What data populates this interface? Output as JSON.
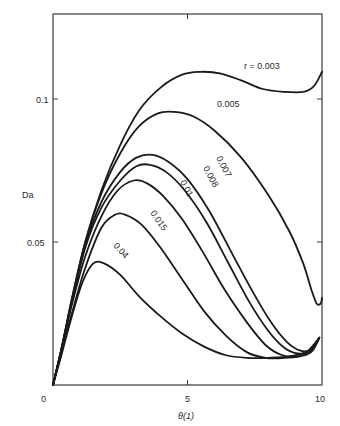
{
  "chart_data": {
    "type": "line",
    "title": "",
    "xlabel": "θ(1)",
    "ylabel": "Da",
    "xlim": [
      0,
      10
    ],
    "ylim": [
      0,
      0.13
    ],
    "grid": false,
    "legend": "inline curve labels",
    "x_ticks": [
      "0",
      "5",
      "10"
    ],
    "y_ticks": [
      "0.05",
      "0.1"
    ],
    "series": [
      {
        "name": "r = 0.003",
        "label": "r = 0.003",
        "points": [
          [
            0,
            0
          ],
          [
            0.3,
            0.012
          ],
          [
            0.7,
            0.03
          ],
          [
            1.2,
            0.05
          ],
          [
            1.8,
            0.068
          ],
          [
            2.5,
            0.084
          ],
          [
            3.2,
            0.096
          ],
          [
            4.0,
            0.104
          ],
          [
            4.8,
            0.1085
          ],
          [
            5.5,
            0.1095
          ],
          [
            6.2,
            0.109
          ],
          [
            7.0,
            0.1065
          ],
          [
            7.8,
            0.1035
          ],
          [
            8.6,
            0.1025
          ],
          [
            9.3,
            0.1025
          ],
          [
            9.7,
            0.1045
          ],
          [
            10,
            0.1095
          ]
        ]
      },
      {
        "name": "0.005",
        "label": "0.005",
        "points": [
          [
            0,
            0
          ],
          [
            0.3,
            0.012
          ],
          [
            0.7,
            0.03
          ],
          [
            1.2,
            0.05
          ],
          [
            1.8,
            0.067
          ],
          [
            2.5,
            0.081
          ],
          [
            3.2,
            0.0905
          ],
          [
            3.9,
            0.095
          ],
          [
            4.5,
            0.0955
          ],
          [
            5.2,
            0.094
          ],
          [
            6.0,
            0.089
          ],
          [
            7.0,
            0.0795
          ],
          [
            8.0,
            0.0665
          ],
          [
            8.8,
            0.0535
          ],
          [
            9.3,
            0.0425
          ],
          [
            9.6,
            0.0335
          ],
          [
            9.8,
            0.0285
          ],
          [
            9.95,
            0.0285
          ],
          [
            10,
            0.0305
          ]
        ]
      },
      {
        "name": "0.007",
        "label": "0.007",
        "points": [
          [
            0,
            0
          ],
          [
            0.3,
            0.012
          ],
          [
            0.7,
            0.029
          ],
          [
            1.2,
            0.049
          ],
          [
            1.8,
            0.064
          ],
          [
            2.5,
            0.0745
          ],
          [
            3.1,
            0.0795
          ],
          [
            3.7,
            0.0805
          ],
          [
            4.3,
            0.078
          ],
          [
            5.0,
            0.072
          ],
          [
            5.8,
            0.061
          ],
          [
            6.6,
            0.047
          ],
          [
            7.4,
            0.033
          ],
          [
            8.1,
            0.022
          ],
          [
            8.7,
            0.015
          ],
          [
            9.2,
            0.012
          ],
          [
            9.6,
            0.0125
          ],
          [
            9.9,
            0.0165
          ]
        ]
      },
      {
        "name": "0.008",
        "label": "0.008",
        "points": [
          [
            0,
            0
          ],
          [
            0.3,
            0.012
          ],
          [
            0.7,
            0.029
          ],
          [
            1.2,
            0.048
          ],
          [
            1.8,
            0.062
          ],
          [
            2.5,
            0.0715
          ],
          [
            3.1,
            0.0765
          ],
          [
            3.6,
            0.077
          ],
          [
            4.2,
            0.0745
          ],
          [
            4.9,
            0.068
          ],
          [
            5.7,
            0.057
          ],
          [
            6.5,
            0.043
          ],
          [
            7.3,
            0.029
          ],
          [
            8.0,
            0.019
          ],
          [
            8.6,
            0.013
          ],
          [
            9.1,
            0.011
          ],
          [
            9.6,
            0.012
          ],
          [
            9.9,
            0.0165
          ]
        ]
      },
      {
        "name": "0.01",
        "label": "0.01",
        "points": [
          [
            0,
            0
          ],
          [
            0.3,
            0.012
          ],
          [
            0.7,
            0.028
          ],
          [
            1.2,
            0.045
          ],
          [
            1.8,
            0.059
          ],
          [
            2.4,
            0.068
          ],
          [
            3.0,
            0.0715
          ],
          [
            3.5,
            0.0705
          ],
          [
            4.1,
            0.066
          ],
          [
            4.8,
            0.058
          ],
          [
            5.6,
            0.046
          ],
          [
            6.4,
            0.033
          ],
          [
            7.2,
            0.022
          ],
          [
            7.9,
            0.014
          ],
          [
            8.5,
            0.0105
          ],
          [
            9.1,
            0.01
          ],
          [
            9.6,
            0.0115
          ],
          [
            9.9,
            0.0165
          ]
        ]
      },
      {
        "name": "0.015",
        "label": "0.015",
        "points": [
          [
            0,
            0
          ],
          [
            0.3,
            0.011
          ],
          [
            0.7,
            0.025
          ],
          [
            1.2,
            0.041
          ],
          [
            1.8,
            0.055
          ],
          [
            2.3,
            0.0595
          ],
          [
            2.7,
            0.0595
          ],
          [
            3.3,
            0.056
          ],
          [
            4.0,
            0.048
          ],
          [
            4.8,
            0.037
          ],
          [
            5.6,
            0.026
          ],
          [
            6.4,
            0.0175
          ],
          [
            7.2,
            0.0115
          ],
          [
            7.9,
            0.0095
          ],
          [
            8.6,
            0.0095
          ],
          [
            9.3,
            0.0105
          ],
          [
            9.9,
            0.0165
          ]
        ]
      },
      {
        "name": "0.04",
        "label": "0.04",
        "points": [
          [
            0,
            0
          ],
          [
            0.3,
            0.01
          ],
          [
            0.7,
            0.024
          ],
          [
            1.1,
            0.036
          ],
          [
            1.5,
            0.0425
          ],
          [
            1.9,
            0.0425
          ],
          [
            2.5,
            0.0385
          ],
          [
            3.2,
            0.031
          ],
          [
            4.0,
            0.024
          ],
          [
            4.8,
            0.018
          ],
          [
            5.6,
            0.0135
          ],
          [
            6.4,
            0.0105
          ],
          [
            7.2,
            0.0095
          ],
          [
            8.0,
            0.0095
          ],
          [
            8.8,
            0.01
          ],
          [
            9.5,
            0.012
          ],
          [
            9.9,
            0.0165
          ]
        ]
      }
    ]
  },
  "labels": {
    "ylabel": "Da",
    "xlabel": "θ(1)",
    "xtick0": "0",
    "xtick5": "5",
    "xtick10": "10",
    "ytick005": "0.05",
    "ytick01": "0.1",
    "curve_0003": "r = 0.003",
    "curve_0005": "0.005",
    "curve_0007": "0.007",
    "curve_0008": "0.008",
    "curve_001": "0.01",
    "curve_0015": "0.015",
    "curve_004": "0.04"
  }
}
